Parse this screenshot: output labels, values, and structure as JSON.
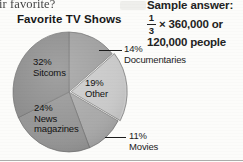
{
  "page": {
    "cut_off_line": "ir favorite?"
  },
  "sample_answer": {
    "title": "Sample answer:",
    "fraction_numerator": "1",
    "fraction_denominator": "3",
    "expression_rest": "× 360,000 or",
    "result_line": "120,000 people"
  },
  "chart_data": {
    "type": "pie",
    "title": "Favorite TV Shows",
    "xlabel": "",
    "ylabel": "",
    "legend_position": "none",
    "grid": false,
    "categories": [
      "Sitcoms",
      "News magazines",
      "Movies",
      "Other",
      "Documentaries"
    ],
    "values": [
      32,
      24,
      11,
      19,
      14
    ],
    "unit": "%",
    "slices": [
      {
        "label": "Sitcoms",
        "percent": "32%",
        "percent_value": 32,
        "color": "#8b8b8b",
        "label_placement": "inside",
        "leader_line": false
      },
      {
        "label": "News",
        "label_line2": "magazines",
        "percent": "24%",
        "percent_value": 24,
        "color": "#949494",
        "label_placement": "inside",
        "leader_line": false
      },
      {
        "label": "Movies",
        "percent": "11%",
        "percent_value": 11,
        "color": "#a8a8a8",
        "label_placement": "outside",
        "leader_line": true
      },
      {
        "label": "Other",
        "percent": "19%",
        "percent_value": 19,
        "color": "#c9c9c9",
        "label_placement": "inside",
        "leader_line": false
      },
      {
        "label": "Documentaries",
        "percent": "14%",
        "percent_value": 14,
        "color": "#9e9e9e",
        "label_placement": "outside",
        "leader_line": true
      }
    ]
  }
}
